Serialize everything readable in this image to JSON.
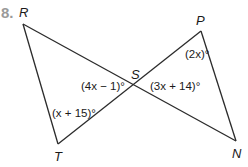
{
  "problem": {
    "number_label": "8."
  },
  "vertices": {
    "R": {
      "label": "R",
      "x": 23,
      "y": 24
    },
    "S": {
      "label": "S",
      "x": 137,
      "y": 84
    },
    "P": {
      "label": "P",
      "x": 201,
      "y": 31
    },
    "T": {
      "label": "T",
      "x": 58,
      "y": 144
    },
    "N": {
      "label": "N",
      "x": 236,
      "y": 141
    }
  },
  "segments": [
    {
      "from": "R",
      "to": "N"
    },
    {
      "from": "T",
      "to": "P"
    },
    {
      "from": "R",
      "to": "T"
    },
    {
      "from": "P",
      "to": "N"
    }
  ],
  "angle_labels": {
    "P": "(2x)°",
    "S_left": "(4x − 1)°",
    "S_right": "(3x + 14)°",
    "T": "(x + 15)°"
  },
  "colors": {
    "line": "#2b2b2b",
    "text": "#1a1a1a",
    "problem_number": "#9a9a9a"
  }
}
